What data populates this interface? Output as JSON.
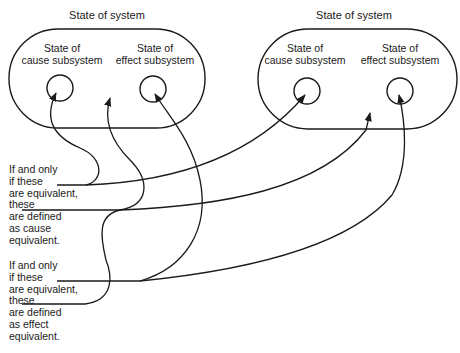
{
  "diagram": {
    "left_system": {
      "title": "State of system",
      "cause": {
        "line1": "State of",
        "line2": "cause subsystem"
      },
      "effect": {
        "line1": "State of",
        "line2": "effect subsystem"
      }
    },
    "right_system": {
      "title": "State of system",
      "cause": {
        "line1": "State of",
        "line2": "cause subsystem"
      },
      "effect": {
        "line1": "State of",
        "line2": "effect subsystem"
      }
    },
    "cause_note": {
      "lines": [
        "If and only",
        "if these",
        "are equivalent,",
        "these",
        "are defined",
        "as cause",
        "equivalent."
      ]
    },
    "effect_note": {
      "lines": [
        "If and only",
        "if these",
        "are equivalent,",
        "these",
        "are defined",
        "as effect",
        "equivalent."
      ]
    },
    "colors": {
      "ink": "#1a1a1a",
      "background": "#ffffff"
    }
  }
}
